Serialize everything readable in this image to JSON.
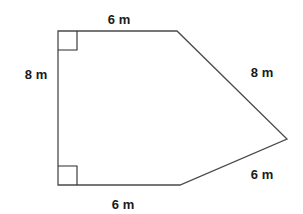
{
  "figure": {
    "type": "pentagon-irregular",
    "stroke_color": "#4a4a4a",
    "label_color": "#1a1a1a"
  },
  "vertices": [
    {
      "name": "top-left",
      "x": 58,
      "y": 31
    },
    {
      "name": "top-right",
      "x": 177,
      "y": 31
    },
    {
      "name": "right-apex",
      "x": 287,
      "y": 139
    },
    {
      "name": "bottom-right",
      "x": 180,
      "y": 185
    },
    {
      "name": "bottom-left",
      "x": 58,
      "y": 185
    }
  ],
  "right_angles": [
    {
      "corner": "top-left",
      "size": 19
    },
    {
      "corner": "bottom-left",
      "size": 19
    }
  ],
  "labels": {
    "top": "6 m",
    "left": "8 m",
    "upper_right": "8 m",
    "lower_right": "6 m",
    "bottom": "6 m"
  }
}
